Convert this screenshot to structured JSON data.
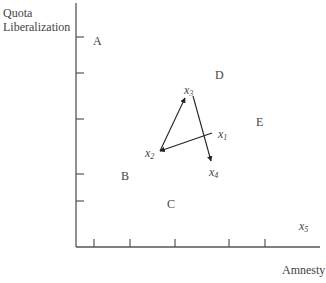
{
  "axes": {
    "y_label_line1": "Quota",
    "y_label_line2": "Liberalization",
    "x_label": "Amnesty"
  },
  "points": [
    {
      "id": "A",
      "label": "A"
    },
    {
      "id": "B",
      "label": "B"
    },
    {
      "id": "C",
      "label": "C"
    },
    {
      "id": "D",
      "label": "D"
    },
    {
      "id": "E",
      "label": "E"
    }
  ],
  "status_quo_points": [
    {
      "id": "x1",
      "base": "x",
      "sub": "1"
    },
    {
      "id": "x2",
      "base": "x",
      "sub": "2"
    },
    {
      "id": "x3",
      "base": "x",
      "sub": "3"
    },
    {
      "id": "x4",
      "base": "x",
      "sub": "4"
    },
    {
      "id": "x5",
      "base": "x",
      "sub": "5"
    }
  ],
  "path": [
    "x1",
    "x2",
    "x3",
    "x4"
  ],
  "colors": {
    "ink": "#333333"
  }
}
